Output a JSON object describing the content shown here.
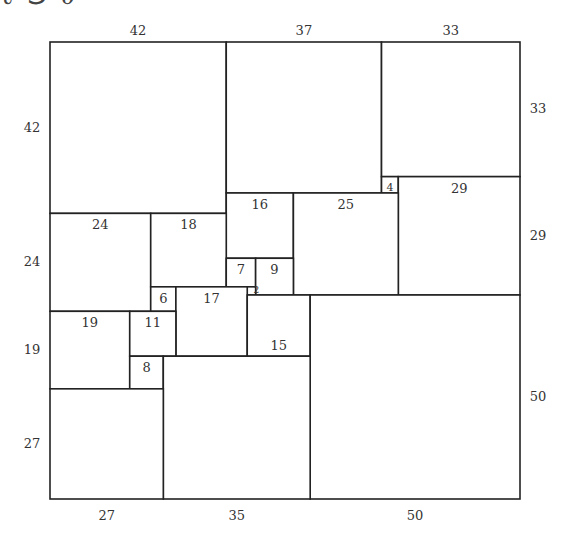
{
  "header_fragment": "ℓ ⅁ ∂",
  "diagram": {
    "total_size": 112,
    "top_labels": [
      {
        "v": "42",
        "u": 21
      },
      {
        "v": "37",
        "u": 60.5
      },
      {
        "v": "33",
        "u": 95.5
      }
    ],
    "bottom_labels": [
      {
        "v": "27",
        "u": 13.5
      },
      {
        "v": "35",
        "u": 44.5
      },
      {
        "v": "50",
        "u": 87
      }
    ],
    "left_labels": [
      {
        "v": "42",
        "u": 21
      },
      {
        "v": "24",
        "u": 54
      },
      {
        "v": "19",
        "u": 75.5
      },
      {
        "v": "27",
        "u": 98.5
      }
    ],
    "right_labels": [
      {
        "v": "33",
        "u": 16.5
      },
      {
        "v": "29",
        "u": 47.5
      },
      {
        "v": "50",
        "u": 87
      }
    ],
    "squares": [
      {
        "size": 42,
        "x": 0,
        "y": 0,
        "label": ""
      },
      {
        "size": 37,
        "x": 42,
        "y": 0,
        "label": ""
      },
      {
        "size": 33,
        "x": 79,
        "y": 0,
        "label": ""
      },
      {
        "size": 4,
        "x": 79,
        "y": 33,
        "label": "4"
      },
      {
        "size": 29,
        "x": 83,
        "y": 33,
        "label": "29"
      },
      {
        "size": 16,
        "x": 42,
        "y": 37,
        "label": "16"
      },
      {
        "size": 25,
        "x": 58,
        "y": 37,
        "label": "25"
      },
      {
        "size": 24,
        "x": 0,
        "y": 42,
        "label": "24"
      },
      {
        "size": 18,
        "x": 24,
        "y": 42,
        "label": "18"
      },
      {
        "size": 7,
        "x": 42,
        "y": 53,
        "label": "7"
      },
      {
        "size": 9,
        "x": 49,
        "y": 53,
        "label": "9"
      },
      {
        "size": 2,
        "x": 47,
        "y": 60,
        "label": "2"
      },
      {
        "size": 6,
        "x": 24,
        "y": 60,
        "label": "6"
      },
      {
        "size": 17,
        "x": 30,
        "y": 60,
        "label": "17"
      },
      {
        "size": 15,
        "x": 47,
        "y": 62,
        "label": "15",
        "label_bottom": true
      },
      {
        "size": 50,
        "x": 62,
        "y": 62,
        "label": ""
      },
      {
        "size": 19,
        "x": 0,
        "y": 66,
        "label": "19"
      },
      {
        "size": 11,
        "x": 19,
        "y": 66,
        "label": "11"
      },
      {
        "size": 8,
        "x": 19,
        "y": 77,
        "label": "8"
      },
      {
        "size": 35,
        "x": 27,
        "y": 77,
        "label": ""
      },
      {
        "size": 27,
        "x": 0,
        "y": 85,
        "label": ""
      }
    ]
  }
}
